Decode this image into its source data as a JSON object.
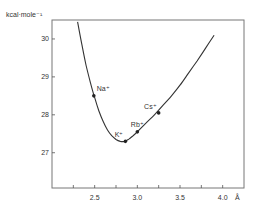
{
  "chart_data": {
    "type": "line",
    "title": "",
    "xlabel": "Å",
    "ylabel": "kcal·mole⁻¹",
    "xlim": [
      2.0,
      4.25
    ],
    "ylim": [
      26.07,
      30.5
    ],
    "grid": false,
    "legend": "none",
    "x_ticks": [
      {
        "value": 2.25,
        "label": ""
      },
      {
        "value": 2.5,
        "label": "2.5"
      },
      {
        "value": 2.75,
        "label": ""
      },
      {
        "value": 3.0,
        "label": "3.0"
      },
      {
        "value": 3.25,
        "label": ""
      },
      {
        "value": 3.5,
        "label": "3.5"
      },
      {
        "value": 3.75,
        "label": ""
      },
      {
        "value": 4.0,
        "label": "4.0"
      }
    ],
    "y_ticks": [
      {
        "value": 27,
        "label": "27"
      },
      {
        "value": 28,
        "label": "28"
      },
      {
        "value": 29,
        "label": "29"
      },
      {
        "value": 30,
        "label": "30"
      }
    ],
    "series": [
      {
        "name": "energy curve",
        "x": [
          2.3,
          2.35,
          2.4,
          2.45,
          2.5,
          2.55,
          2.6,
          2.65,
          2.7,
          2.75,
          2.8,
          2.85,
          2.9,
          2.95,
          3.0,
          3.1,
          3.2,
          3.3,
          3.4,
          3.5,
          3.6,
          3.7,
          3.8,
          3.9
        ],
        "y": [
          30.45,
          29.85,
          29.3,
          28.85,
          28.45,
          28.1,
          27.82,
          27.6,
          27.45,
          27.35,
          27.3,
          27.3,
          27.36,
          27.45,
          27.55,
          27.78,
          28.0,
          28.25,
          28.5,
          28.78,
          29.1,
          29.42,
          29.76,
          30.1
        ]
      }
    ],
    "points": [
      {
        "label": "Na⁺",
        "x": 2.49,
        "y": 28.5,
        "label_pos": "right"
      },
      {
        "label": "K⁺",
        "x": 2.86,
        "y": 27.3,
        "label_pos": "above-left"
      },
      {
        "label": "Rb⁺",
        "x": 3.0,
        "y": 27.55,
        "label_pos": "above"
      },
      {
        "label": "Cs⁺",
        "x": 3.25,
        "y": 28.05,
        "label_pos": "above-left"
      }
    ]
  }
}
